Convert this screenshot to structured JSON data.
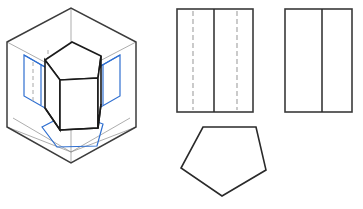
{
  "figure": {
    "background": "#ffffff",
    "width": 363,
    "height": 209
  },
  "colors": {
    "object_line": "#1a1a1a",
    "box_line": "#3c3c3c",
    "thin_line": "#8a8a8a",
    "hidden_line": "#a8a8a8",
    "projection_blue": "#2f6fd0",
    "paper": "#ffffff"
  },
  "panels": {
    "isometric": {
      "name": "isometric-glass-box",
      "description": "Pentagonal prism suspended inside an isometric projection box with blue projection planes",
      "hex_box": {
        "points": "7,42 71,8 136,42 136,127 71,163 7,127",
        "note": "outer hexagonal glass-box silhouette"
      },
      "box_inner_edges": [
        "71,8 71,52",
        "7,42 71,76 136,42",
        "71,76 71,163"
      ],
      "floor_edges": "13,118 71,152 130,118",
      "blue_planes": {
        "left_plane": "24,55 66,79 66,119 24,96",
        "right_plane": "78,79 120,55 120,96 78,119",
        "left_plane_inner": "41,64 41,105",
        "right_plane_inner": "103,64 103,105",
        "bottom_pentagon": "42,127 71,112 103,124 97,145 57,146"
      },
      "hidden_lines": [
        "33,60 33,101",
        "48,51 48,69"
      ],
      "prism": {
        "top_face": "45,60 72,42 101,56 98,78 60,80",
        "vertical_edges": [
          "45,60 45,108",
          "60,80 60,130",
          "98,78 98,128",
          "101,56 101,104",
          "72,42 72,44"
        ],
        "bottom_face": "45,108 60,130 98,128 101,104",
        "label": "pentagonal prism"
      }
    },
    "front_view": {
      "name": "front-view",
      "rect": {
        "x": 177,
        "y": 9,
        "w": 76,
        "h": 103
      },
      "solid_center_line_x": 214,
      "hidden_lines_x": [
        193,
        237
      ],
      "line_style_hidden": "dashed",
      "description": "Front orthographic view: rectangle with one solid vertical edge and two hidden (dashed) edges"
    },
    "side_view": {
      "name": "side-view",
      "rect": {
        "x": 285,
        "y": 9,
        "w": 67,
        "h": 103
      },
      "solid_center_line_x": 322,
      "description": "Side orthographic view: rectangle with one solid vertical edge"
    },
    "top_view": {
      "name": "top-view-pentagon",
      "points": "203,127 256,127 266,170 222,196 181,168",
      "description": "Top orthographic view: regular pentagon with flat top edge and apex pointing down"
    }
  }
}
